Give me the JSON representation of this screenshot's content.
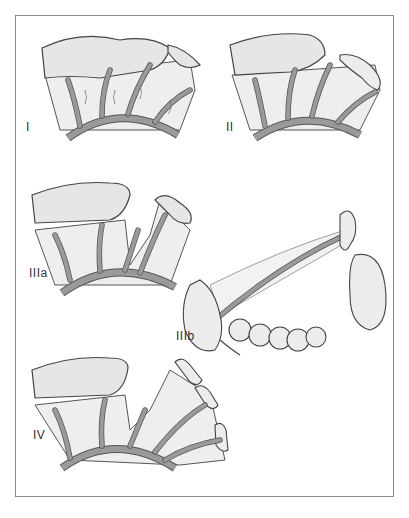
{
  "figure": {
    "panels": [
      {
        "id": "I",
        "label": "I"
      },
      {
        "id": "II",
        "label": "II"
      },
      {
        "id": "IIIa",
        "label": "IIIa"
      },
      {
        "id": "IIIb",
        "label": "IIIb"
      },
      {
        "id": "IV",
        "label": "IV"
      }
    ],
    "colors": {
      "frame": "#8a8a8a",
      "vessel": "#9a9a9a",
      "tissue": "#eeeeee",
      "outline": "#444444"
    }
  }
}
